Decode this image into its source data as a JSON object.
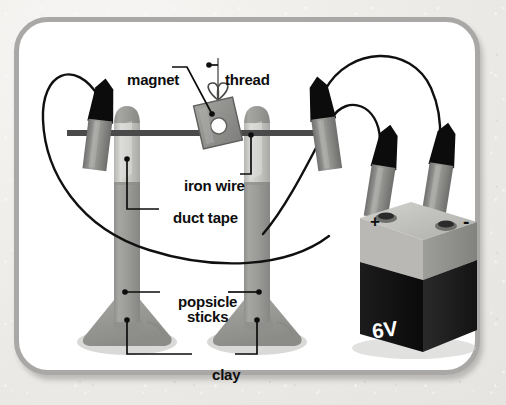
{
  "figure": {
    "frame_color": "#a9a8a6",
    "background_color": "#ffffff",
    "page_background": "#ecebe8"
  },
  "labels": {
    "magnet": "magnet",
    "thread": "thread",
    "iron_wire": "iron wire",
    "duct_tape": "duct tape",
    "popsicle_sticks_line1": "popsicle",
    "popsicle_sticks_line2": "sticks",
    "clay": "clay"
  },
  "battery": {
    "voltage_label": "6V",
    "positive_terminal": "+",
    "negative_terminal": "-",
    "body_color": "#151515",
    "cap_color": "#b9b8b5"
  },
  "colors": {
    "wire": "#101010",
    "iron_wire_bar": "#4a4a4a",
    "popsicle_stick": "#9a9a98",
    "duct_tape": "#c9c9c6",
    "clay": "#9c9c99",
    "clip_tip": "#0c0c0c",
    "clip_body": "#8c8c8a",
    "magnet": "#8f8f8d",
    "thread": "#6d6d6b",
    "label_text": "#0d0d0d"
  },
  "parts": [
    {
      "name": "magnet",
      "description": "small square magnet with center hole hanging from thread"
    },
    {
      "name": "thread",
      "description": "vertical thread tied in a bow to the magnet"
    },
    {
      "name": "iron-wire",
      "description": "horizontal iron wire spanning between the two sticks"
    },
    {
      "name": "duct-tape",
      "description": "tape band wrapped around each popsicle stick"
    },
    {
      "name": "popsicle-sticks",
      "description": "two vertical popsicle sticks acting as posts"
    },
    {
      "name": "clay",
      "description": "clay mounds at the base of each stick"
    },
    {
      "name": "battery",
      "description": "6V lantern battery with plus and minus terminals"
    },
    {
      "name": "alligator-clips",
      "description": "four alligator clips connecting wires"
    }
  ]
}
